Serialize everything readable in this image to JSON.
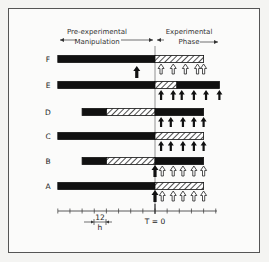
{
  "header": {
    "left_title_line1": "Pre-experimental",
    "left_title_line2": "Manipulation",
    "right_title_line1": "Experimental",
    "right_title_line2": "Phase"
  },
  "axis": {
    "t0_label": "T = 0",
    "scale_value": "12",
    "scale_unit": "h",
    "tick_count": 14,
    "tick_interval_hours": 12
  },
  "rows": [
    {
      "label": "F",
      "segments": [
        {
          "type": "solid",
          "from": -8,
          "to": 0
        },
        {
          "type": "hatched",
          "from": 0,
          "to": 4
        }
      ],
      "pre_arrow": {
        "at": -1.5,
        "kind": "solid"
      },
      "arrows": {
        "kind": "open",
        "at": [
          0.5,
          1.5,
          2.5,
          3.5,
          4
        ]
      }
    },
    {
      "label": "E",
      "segments": [
        {
          "type": "solid",
          "from": -8,
          "to": 0
        },
        {
          "type": "hatched",
          "from": 0,
          "to": 1.8
        },
        {
          "type": "solid",
          "from": 1.8,
          "to": 5.3
        }
      ],
      "arrows": {
        "kind": "solid",
        "at": [
          0.5,
          1.5,
          2.2,
          3.2,
          4.2,
          5.3
        ]
      }
    },
    {
      "label": "D",
      "segments": [
        {
          "type": "solid",
          "from": -6,
          "to": -4
        },
        {
          "type": "hatched",
          "from": -4,
          "to": 0
        },
        {
          "type": "solid",
          "from": 0,
          "to": 4
        }
      ],
      "arrows": {
        "kind": "solid",
        "at": [
          0.5,
          1.3,
          2.3,
          3.2,
          4
        ]
      }
    },
    {
      "label": "C",
      "segments": [
        {
          "type": "solid",
          "from": -8,
          "to": 0
        },
        {
          "type": "hatched",
          "from": 0,
          "to": 4
        }
      ],
      "arrows": {
        "kind": "solid",
        "at": [
          0.5,
          1.3,
          2.3,
          3.2,
          4
        ]
      }
    },
    {
      "label": "B",
      "segments": [
        {
          "type": "solid",
          "from": -6,
          "to": -4
        },
        {
          "type": "hatched",
          "from": -4,
          "to": 0
        },
        {
          "type": "solid",
          "from": 0,
          "to": 4
        }
      ],
      "t0_arrow": "solid",
      "arrows": {
        "kind": "open",
        "at": [
          0.6,
          1.5,
          2.3,
          3.2,
          4
        ]
      }
    },
    {
      "label": "A",
      "segments": [
        {
          "type": "solid",
          "from": -8,
          "to": 0
        },
        {
          "type": "hatched",
          "from": 0,
          "to": 4
        }
      ],
      "t0_arrow": "solid",
      "arrows": {
        "kind": "open",
        "at": [
          0.6,
          1.5,
          2.3,
          3.2,
          4
        ]
      }
    }
  ]
}
